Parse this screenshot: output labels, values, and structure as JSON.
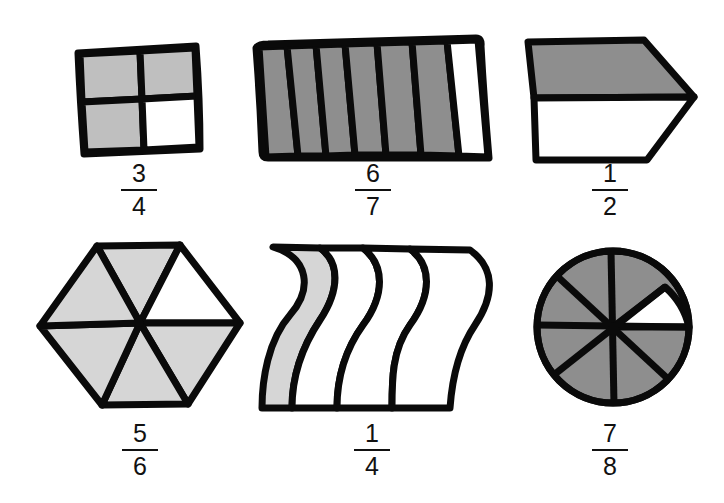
{
  "colors": {
    "stroke": "#0a0a0a",
    "shade_light": "#bfbfbf",
    "shade_dark": "#8e8e8e",
    "shade_pale": "#d6d6d6",
    "unshaded": "#ffffff",
    "background": "#ffffff"
  },
  "figures": [
    {
      "id": "square",
      "shape": "square divided into 4 equal parts",
      "parts": 4,
      "shaded": 3,
      "fraction": {
        "numerator": "3",
        "denominator": "4"
      }
    },
    {
      "id": "stripes",
      "shape": "rectangle divided into 7 vertical strips",
      "parts": 7,
      "shaded": 6,
      "fraction": {
        "numerator": "6",
        "denominator": "7"
      }
    },
    {
      "id": "pentagon",
      "shape": "arrow pentagon divided into 2 horizontal halves",
      "parts": 2,
      "shaded": 1,
      "fraction": {
        "numerator": "1",
        "denominator": "2"
      }
    },
    {
      "id": "hexagon",
      "shape": "hexagon divided into 6 triangles",
      "parts": 6,
      "shaded": 5,
      "fraction": {
        "numerator": "5",
        "denominator": "6"
      }
    },
    {
      "id": "wave",
      "shape": "wavy shape divided into 4 strips",
      "parts": 4,
      "shaded": 1,
      "fraction": {
        "numerator": "1",
        "denominator": "4"
      }
    },
    {
      "id": "circle",
      "shape": "circle divided into 8 sectors",
      "parts": 8,
      "shaded": 7,
      "fraction": {
        "numerator": "7",
        "denominator": "8"
      }
    }
  ]
}
